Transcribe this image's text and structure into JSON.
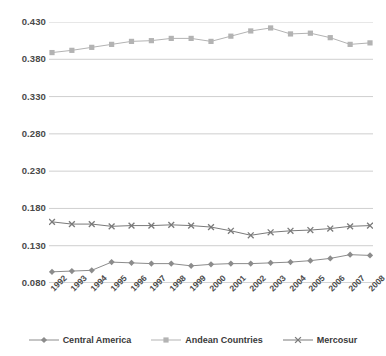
{
  "chart_data": {
    "type": "line",
    "title": "",
    "xlabel": "",
    "ylabel": "",
    "ylim": [
      0.08,
      0.43
    ],
    "ytick_step": 0.05,
    "grid": true,
    "legend_position": "bottom",
    "categories": [
      "1992",
      "1993",
      "1994",
      "1995",
      "1996",
      "1997",
      "1998",
      "1999",
      "2000",
      "2001",
      "2002",
      "2003",
      "2004",
      "2005",
      "2006",
      "2007",
      "2008"
    ],
    "yticks": [
      "0.430",
      "0.380",
      "0.330",
      "0.280",
      "0.230",
      "0.180",
      "0.130",
      "0.080"
    ],
    "ytick_values": [
      0.43,
      0.38,
      0.33,
      0.28,
      0.23,
      0.18,
      0.13,
      0.08
    ],
    "series": [
      {
        "name": "Central America",
        "marker": "diamond",
        "color": "#8c8c8c",
        "values": [
          0.095,
          0.096,
          0.097,
          0.108,
          0.107,
          0.106,
          0.106,
          0.103,
          0.105,
          0.106,
          0.106,
          0.107,
          0.108,
          0.11,
          0.113,
          0.118,
          0.117
        ]
      },
      {
        "name": "Andean Countries",
        "marker": "square",
        "color": "#b3b3b3",
        "values": [
          0.389,
          0.392,
          0.396,
          0.4,
          0.404,
          0.405,
          0.408,
          0.408,
          0.404,
          0.411,
          0.418,
          0.422,
          0.414,
          0.415,
          0.409,
          0.4,
          0.402
        ]
      },
      {
        "name": "Mercosur",
        "marker": "cross",
        "color": "#7a7a7a",
        "values": [
          0.162,
          0.159,
          0.159,
          0.156,
          0.157,
          0.157,
          0.158,
          0.157,
          0.155,
          0.15,
          0.144,
          0.148,
          0.15,
          0.151,
          0.153,
          0.156,
          0.157
        ]
      }
    ]
  },
  "legend": {
    "items": [
      {
        "label": "Central America",
        "marker": "diamond",
        "color": "#8c8c8c"
      },
      {
        "label": "Andean Countries",
        "marker": "square",
        "color": "#b3b3b3"
      },
      {
        "label": "Mercosur",
        "marker": "cross",
        "color": "#7a7a7a"
      }
    ]
  },
  "axis": {
    "gridline_color": "#cfcfcf",
    "baseline_color": "#a9a9a9"
  }
}
